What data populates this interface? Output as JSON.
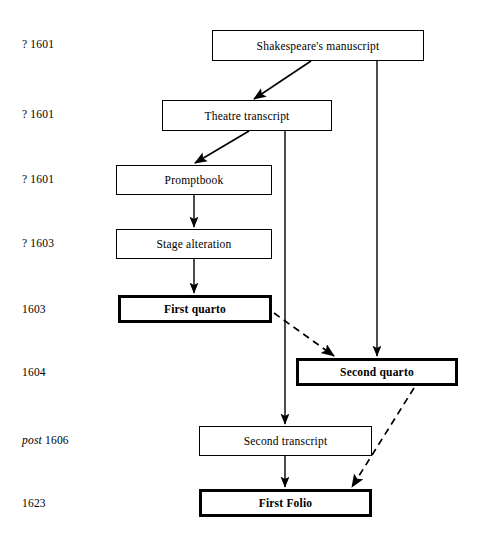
{
  "diagram": {
    "width": 478,
    "height": 543,
    "background": "#ffffff",
    "line_color": "#000000",
    "dates": [
      {
        "id": "date-1",
        "prefix": "?",
        "prefix_style": "plain",
        "year": "1601",
        "x": 22,
        "y": 38
      },
      {
        "id": "date-2",
        "prefix": "?",
        "prefix_style": "plain",
        "year": "1601",
        "x": 22,
        "y": 108
      },
      {
        "id": "date-3",
        "prefix": "?",
        "prefix_style": "plain",
        "year": "1601",
        "x": 22,
        "y": 173
      },
      {
        "id": "date-4",
        "prefix": "?",
        "prefix_style": "plain",
        "year": "1603",
        "x": 22,
        "y": 237
      },
      {
        "id": "date-5",
        "prefix": "",
        "prefix_style": "plain",
        "year": "1603",
        "x": 22,
        "y": 303
      },
      {
        "id": "date-6",
        "prefix": "",
        "prefix_style": "plain",
        "year": "1604",
        "x": 22,
        "y": 366
      },
      {
        "id": "date-7",
        "prefix": "post",
        "prefix_style": "italic",
        "year": "1606",
        "x": 22,
        "y": 434
      },
      {
        "id": "date-8",
        "prefix": "",
        "prefix_style": "plain",
        "year": "1623",
        "x": 22,
        "y": 497
      }
    ],
    "nodes": [
      {
        "id": "shakespeares-manuscript",
        "label": "Shakespeare's manuscript",
        "x": 212,
        "y": 30,
        "w": 212,
        "h": 31,
        "emphasis": "normal"
      },
      {
        "id": "theatre-transcript",
        "label": "Theatre transcript",
        "x": 162,
        "y": 100,
        "w": 170,
        "h": 31,
        "emphasis": "normal"
      },
      {
        "id": "promptbook",
        "label": "Promptbook",
        "x": 116,
        "y": 165,
        "w": 156,
        "h": 30,
        "emphasis": "normal"
      },
      {
        "id": "stage-alteration",
        "label": "Stage alteration",
        "x": 116,
        "y": 229,
        "w": 156,
        "h": 30,
        "emphasis": "normal"
      },
      {
        "id": "first-quarto",
        "label": "First quarto",
        "x": 118,
        "y": 295,
        "w": 154,
        "h": 28,
        "emphasis": "bold"
      },
      {
        "id": "second-quarto",
        "label": "Second quarto",
        "x": 296,
        "y": 358,
        "w": 162,
        "h": 28,
        "emphasis": "bold"
      },
      {
        "id": "second-transcript",
        "label": "Second transcript",
        "x": 199,
        "y": 426,
        "w": 173,
        "h": 30,
        "emphasis": "normal"
      },
      {
        "id": "first-folio",
        "label": "First Folio",
        "x": 199,
        "y": 489,
        "w": 173,
        "h": 28,
        "emphasis": "bold"
      }
    ],
    "edges": [
      {
        "id": "edge-manuscript-to-theatre",
        "from": "shakespeares-manuscript",
        "to": "theatre-transcript",
        "style": "solid",
        "kind": "diagonal"
      },
      {
        "id": "edge-manuscript-to-second-quarto",
        "from": "shakespeares-manuscript",
        "to": "second-quarto",
        "style": "solid",
        "kind": "vertical"
      },
      {
        "id": "edge-theatre-to-promptbook",
        "from": "theatre-transcript",
        "to": "promptbook",
        "style": "solid",
        "kind": "diagonal"
      },
      {
        "id": "edge-theatre-to-second-transcript",
        "from": "theatre-transcript",
        "to": "second-transcript",
        "style": "solid",
        "kind": "vertical"
      },
      {
        "id": "edge-promptbook-to-stage-alteration",
        "from": "promptbook",
        "to": "stage-alteration",
        "style": "solid",
        "kind": "vertical"
      },
      {
        "id": "edge-stage-alteration-to-first-quarto",
        "from": "stage-alteration",
        "to": "first-quarto",
        "style": "solid",
        "kind": "vertical"
      },
      {
        "id": "edge-first-quarto-to-second-quarto",
        "from": "first-quarto",
        "to": "second-quarto",
        "style": "dashed",
        "kind": "diagonal"
      },
      {
        "id": "edge-second-quarto-to-first-folio",
        "from": "second-quarto",
        "to": "first-folio",
        "style": "dashed",
        "kind": "diagonal"
      },
      {
        "id": "edge-second-transcript-to-first-folio",
        "from": "second-transcript",
        "to": "first-folio",
        "style": "solid",
        "kind": "vertical"
      }
    ]
  }
}
